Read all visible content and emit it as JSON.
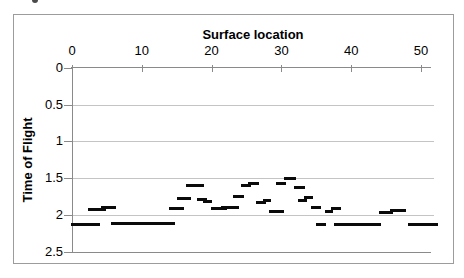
{
  "chart_data": {
    "type": "scatter",
    "marker_style": "horizontal-dash",
    "title": "Surface location",
    "xlabel": "Surface location",
    "ylabel": "Time of Flight",
    "legend": "none",
    "grid": "horizontal",
    "x_axis": {
      "position": "top",
      "ticks": [
        0,
        10,
        20,
        30,
        40,
        50
      ],
      "range": [
        0,
        52
      ]
    },
    "y_axis": {
      "position": "left",
      "tick_labels": [
        "0",
        "0.5",
        "1",
        "1.5",
        "2",
        "2.5"
      ],
      "tick_values": [
        0,
        0.5,
        1,
        1.5,
        2,
        2.5
      ],
      "range": [
        0,
        2.5
      ],
      "reversed": true
    },
    "colors": {
      "marker": "#0a0a0a",
      "gridline": "#c4c4c4",
      "axis": "#8a8a8a",
      "frame": "#9c9c9c",
      "text": "#000000",
      "background": "#ffffff"
    },
    "series": [
      {
        "name": "Time of Flight",
        "segments": [
          {
            "x1": -0.1,
            "x2": 4.0,
            "t": 2.13
          },
          {
            "x1": 2.3,
            "x2": 4.9,
            "t": 1.93
          },
          {
            "x1": 4.2,
            "x2": 6.3,
            "t": 1.9
          },
          {
            "x1": 5.6,
            "x2": 14.8,
            "t": 2.12
          },
          {
            "x1": 13.9,
            "x2": 16.0,
            "t": 1.92
          },
          {
            "x1": 15.1,
            "x2": 17.0,
            "t": 1.78
          },
          {
            "x1": 16.3,
            "x2": 18.9,
            "t": 1.6
          },
          {
            "x1": 17.9,
            "x2": 19.4,
            "t": 1.79
          },
          {
            "x1": 18.8,
            "x2": 20.1,
            "t": 1.82
          },
          {
            "x1": 19.9,
            "x2": 22.2,
            "t": 1.92
          },
          {
            "x1": 21.4,
            "x2": 23.9,
            "t": 1.9
          },
          {
            "x1": 23.1,
            "x2": 24.7,
            "t": 1.75
          },
          {
            "x1": 24.2,
            "x2": 25.6,
            "t": 1.6
          },
          {
            "x1": 25.2,
            "x2": 26.8,
            "t": 1.57
          },
          {
            "x1": 26.3,
            "x2": 27.8,
            "t": 1.83
          },
          {
            "x1": 27.3,
            "x2": 28.5,
            "t": 1.8
          },
          {
            "x1": 28.2,
            "x2": 30.4,
            "t": 1.95
          },
          {
            "x1": 29.2,
            "x2": 30.7,
            "t": 1.58
          },
          {
            "x1": 30.4,
            "x2": 32.1,
            "t": 1.51
          },
          {
            "x1": 31.8,
            "x2": 33.4,
            "t": 1.63
          },
          {
            "x1": 32.4,
            "x2": 33.6,
            "t": 1.8
          },
          {
            "x1": 33.2,
            "x2": 34.5,
            "t": 1.77
          },
          {
            "x1": 34.2,
            "x2": 35.7,
            "t": 1.9
          },
          {
            "x1": 35.0,
            "x2": 36.4,
            "t": 2.13
          },
          {
            "x1": 36.2,
            "x2": 37.4,
            "t": 1.95
          },
          {
            "x1": 37.1,
            "x2": 38.6,
            "t": 1.92
          },
          {
            "x1": 37.6,
            "x2": 44.3,
            "t": 2.13
          },
          {
            "x1": 44.0,
            "x2": 46.0,
            "t": 1.97
          },
          {
            "x1": 45.5,
            "x2": 47.8,
            "t": 1.94
          },
          {
            "x1": 48.2,
            "x2": 52.4,
            "t": 2.13
          }
        ]
      }
    ]
  }
}
